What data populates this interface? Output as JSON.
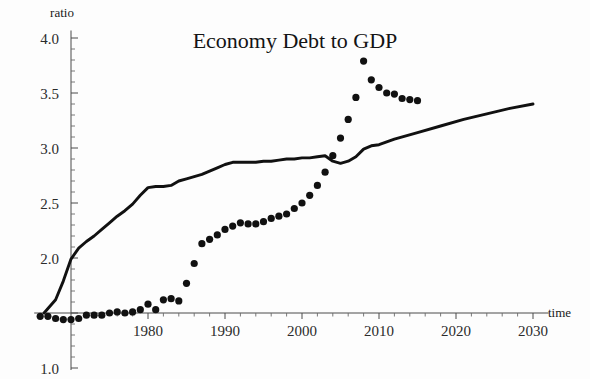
{
  "chart_data": {
    "type": "line",
    "title": "Economy Debt to GDP",
    "xlabel": "time",
    "ylabel": "ratio",
    "grid": false,
    "legend": "none",
    "xlim": [
      1966,
      2031
    ],
    "ylim": [
      1.0,
      4.05
    ],
    "x_ticks": [
      1980,
      1990,
      2000,
      2010,
      2020,
      2030
    ],
    "x_tick_labels": [
      "1980",
      "1990",
      "2000",
      "2010",
      "2020",
      "2030"
    ],
    "x_minor_step": 2,
    "y_ticks": [
      1.0,
      1.5,
      2.0,
      2.5,
      3.0,
      3.5,
      4.0
    ],
    "y_tick_labels": [
      "1.0",
      "",
      "2.0",
      "2.5",
      "3.0",
      "3.5",
      "4.0"
    ],
    "y_labeled_ticks": [
      1.0,
      2.0,
      2.5,
      3.0,
      3.5,
      4.0
    ],
    "y_minor_step": 0.1,
    "axis_origin_x": 1970,
    "axis_origin_y": 1.5,
    "series": [
      {
        "name": "trend-line",
        "style": "solid-line",
        "x": [
          1966.5,
          1968,
          1969,
          1970,
          1971,
          1972,
          1973,
          1974,
          1975,
          1976,
          1977,
          1978,
          1979,
          1980,
          1981,
          1982,
          1983,
          1984,
          1985,
          1986,
          1987,
          1988,
          1989,
          1990,
          1991,
          1992,
          1993,
          1994,
          1995,
          1996,
          1997,
          1998,
          1999,
          2000,
          2001,
          2002,
          2003,
          2004,
          2005,
          2006,
          2007,
          2008,
          2009,
          2010,
          2012,
          2015,
          2018,
          2021,
          2024,
          2027,
          2030
        ],
        "y": [
          1.5,
          1.62,
          1.79,
          1.99,
          2.09,
          2.15,
          2.2,
          2.26,
          2.32,
          2.38,
          2.43,
          2.49,
          2.57,
          2.64,
          2.65,
          2.65,
          2.66,
          2.7,
          2.72,
          2.74,
          2.76,
          2.79,
          2.82,
          2.85,
          2.87,
          2.87,
          2.87,
          2.87,
          2.88,
          2.88,
          2.89,
          2.9,
          2.9,
          2.91,
          2.91,
          2.92,
          2.93,
          2.88,
          2.86,
          2.88,
          2.92,
          2.99,
          3.02,
          3.03,
          3.08,
          3.14,
          3.2,
          3.26,
          3.31,
          3.36,
          3.4
        ]
      },
      {
        "name": "debt-to-gdp-points",
        "style": "dots",
        "x": [
          1966,
          1967,
          1968,
          1969,
          1970,
          1971,
          1972,
          1973,
          1974,
          1975,
          1976,
          1977,
          1978,
          1979,
          1980,
          1981,
          1982,
          1983,
          1984,
          1985,
          1986,
          1987,
          1988,
          1989,
          1990,
          1991,
          1992,
          1993,
          1994,
          1995,
          1996,
          1997,
          1998,
          1999,
          2000,
          2001,
          2002,
          2003,
          2004,
          2005,
          2006,
          2007,
          2008,
          2009,
          2010,
          2011,
          2012,
          2013,
          2014,
          2015
        ],
        "y": [
          1.47,
          1.47,
          1.45,
          1.44,
          1.44,
          1.45,
          1.48,
          1.48,
          1.48,
          1.5,
          1.51,
          1.5,
          1.51,
          1.53,
          1.58,
          1.53,
          1.62,
          1.63,
          1.61,
          1.77,
          1.95,
          2.13,
          2.17,
          2.21,
          2.26,
          2.29,
          2.32,
          2.31,
          2.31,
          2.33,
          2.36,
          2.38,
          2.4,
          2.45,
          2.5,
          2.57,
          2.66,
          2.78,
          2.93,
          3.09,
          3.26,
          3.46,
          3.79,
          3.62,
          3.55,
          3.5,
          3.49,
          3.45,
          3.44,
          3.43
        ]
      }
    ]
  }
}
